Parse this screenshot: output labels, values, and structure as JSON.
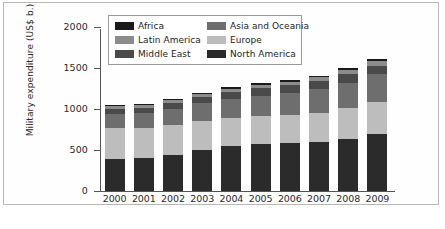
{
  "chart_data": {
    "type": "bar",
    "stacked": true,
    "title": "",
    "xlabel": "",
    "ylabel": "Military expenditure (US$ b.)",
    "ylim": [
      0,
      2000
    ],
    "yticks": [
      0,
      500,
      1000,
      1500,
      2000
    ],
    "ytick_labels": [
      "0",
      "500",
      "1000",
      "1500",
      "2000"
    ],
    "grid": false,
    "legend_position": "upper-left-inside",
    "categories": [
      "2000",
      "2001",
      "2002",
      "2003",
      "2004",
      "2005",
      "2006",
      "2007",
      "2008",
      "2009"
    ],
    "stack_order_bottom_to_top": [
      "North America",
      "Europe",
      "Asia and Oceania",
      "Middle East",
      "Latin America",
      "Africa"
    ],
    "series": [
      {
        "name": "North America",
        "color": "#2b2b2b",
        "values": [
          394,
          403,
          443,
          503,
          546,
          570,
          580,
          601,
          638,
          698
        ]
      },
      {
        "name": "Europe",
        "color": "#bdbdbd",
        "values": [
          379,
          364,
          357,
          345,
          345,
          340,
          345,
          350,
          375,
          392
        ]
      },
      {
        "name": "Asia and Oceania",
        "color": "#6e6e6e",
        "values": [
          170,
          183,
          202,
          220,
          236,
          253,
          273,
          291,
          308,
          336
        ]
      },
      {
        "name": "Middle East",
        "color": "#4a4a4a",
        "values": [
          60,
          65,
          74,
          78,
          82,
          88,
          92,
          97,
          104,
          103
        ]
      },
      {
        "name": "Latin America",
        "color": "#8c8c8c",
        "values": [
          32,
          34,
          35,
          37,
          39,
          42,
          45,
          48,
          51,
          54
        ]
      },
      {
        "name": "Africa",
        "color": "#1a1a1a",
        "values": [
          15,
          16,
          17,
          18,
          19,
          20,
          21,
          22,
          23,
          24
        ]
      }
    ],
    "totals": [
      1050,
      1065,
      1128,
      1201,
      1267,
      1313,
      1356,
      1409,
      1499,
      1607
    ]
  },
  "legend": {
    "entries": [
      {
        "label": "Africa",
        "swatch": "#1a1a1a"
      },
      {
        "label": "Asia and Oceania",
        "swatch": "#6e6e6e"
      },
      {
        "label": "Latin America",
        "swatch": "#8c8c8c"
      },
      {
        "label": "Europe",
        "swatch": "#bdbdbd"
      },
      {
        "label": "Middle East",
        "swatch": "#4a4a4a"
      },
      {
        "label": "North America",
        "swatch": "#2b2b2b"
      }
    ]
  },
  "caption": {
    "text": ""
  }
}
